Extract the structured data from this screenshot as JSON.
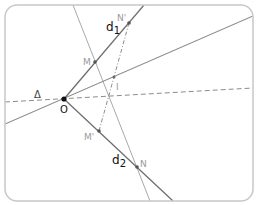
{
  "diagram": {
    "type": "geometry-construction",
    "colors": {
      "frame": "#c8c8c8",
      "line": "#7a7a7a",
      "thin_line": "#a8a8a8",
      "dashed": "#8c8c8c",
      "point": "#555555",
      "point_O": "#111111",
      "label_dark": "#111111",
      "label_gray": "#9a9a9a"
    },
    "labels": {
      "d1": "d",
      "d1_sub": "1",
      "d2": "d",
      "d2_sub": "2",
      "delta": "Δ",
      "O": "O",
      "M": "M",
      "M_prime": "M'",
      "N": "N",
      "N_prime": "N'",
      "I": "I"
    },
    "points": {
      "O": [
        64,
        99
      ],
      "M": [
        95,
        62
      ],
      "N_prime": [
        129,
        23
      ],
      "I": [
        114,
        77
      ],
      "M_prime": [
        99,
        131
      ],
      "N": [
        137,
        167
      ]
    },
    "lines": [
      {
        "name": "d1",
        "style": "solid",
        "from": [
          64,
          99
        ],
        "to": [
          144,
          5
        ]
      },
      {
        "name": "d2",
        "style": "solid",
        "from": [
          64,
          99
        ],
        "to": [
          173,
          201
        ]
      },
      {
        "name": "line-OI",
        "style": "solid",
        "from": [
          5,
          124
        ],
        "to": [
          253,
          16
        ]
      },
      {
        "name": "delta",
        "style": "dashed",
        "from": [
          5,
          102
        ],
        "to": [
          253,
          88
        ]
      },
      {
        "name": "line-MN",
        "style": "thin",
        "from": [
          73,
          5
        ],
        "to": [
          150,
          201
        ]
      },
      {
        "name": "segment-N'M'",
        "style": "dashdot",
        "from": [
          129,
          23
        ],
        "to": [
          99,
          131
        ]
      }
    ]
  }
}
